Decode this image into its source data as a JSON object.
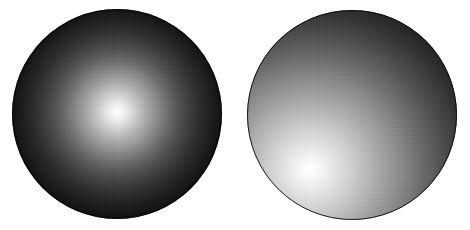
{
  "figure": {
    "background_color": "#ffffff",
    "width": 470,
    "height": 230
  },
  "objects": [
    {
      "id": "sphere-left",
      "label": "Left sphere",
      "shape": "sphere",
      "center_x": 117,
      "center_y": 114,
      "radius": 105,
      "highlight_x": 117,
      "highlight_y": 112,
      "highlight_position": "center",
      "light_direction": "head-on / frontal",
      "highlight_color": "#ffffff",
      "edge_color": "#040404",
      "mid_tone_color": "#6f6f6f",
      "falloff": "radial, symmetric about the center",
      "has_outline_rim": true
    },
    {
      "id": "sphere-right",
      "label": "Right sphere",
      "shape": "sphere",
      "center_x": 352,
      "center_y": 115,
      "radius": 105,
      "highlight_x": 310,
      "highlight_y": 170,
      "highlight_position": "lower-left",
      "light_direction": "lower-left, oblique",
      "highlight_color": "#ffffff",
      "edge_color": "#070707",
      "mid_tone_color": "#818181",
      "falloff": "radial, offset toward the lower-left quadrant",
      "has_outline_rim": true,
      "darkest_region": "upper-right"
    }
  ],
  "chart_data": {
    "type": "scatter",
    "xlabel": "",
    "ylabel": "",
    "xlim": [
      0,
      470
    ],
    "ylim": [
      0,
      230
    ],
    "grid": false,
    "legend": "none",
    "categories": [
      "Left sphere",
      "Right sphere"
    ],
    "series": [
      {
        "name": "center_x",
        "values": [
          117,
          352
        ]
      },
      {
        "name": "center_y",
        "values": [
          114,
          115
        ]
      },
      {
        "name": "radius",
        "values": [
          105,
          105
        ]
      },
      {
        "name": "highlight_x",
        "values": [
          117,
          310
        ]
      },
      {
        "name": "highlight_y",
        "values": [
          112,
          170
        ]
      }
    ],
    "annotations": [
      "Left sphere highlight is centered, producing a symmetric radial gradient from white to near-black.",
      "Right sphere highlight is offset to the lower-left, producing a bright lower-left and near-black upper-right."
    ]
  }
}
